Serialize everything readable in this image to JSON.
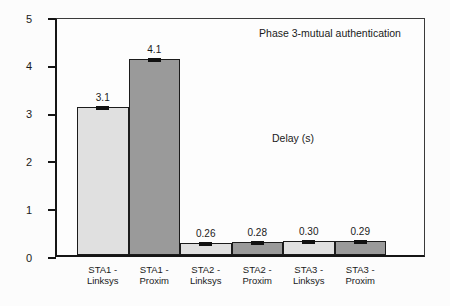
{
  "figure": {
    "background": "#fcfcfc"
  },
  "chart_data": {
    "type": "bar",
    "title": "Phase 3-mutual authentication",
    "annotation": "Delay (s)",
    "categories": [
      "STA1 - Linksys",
      "STA1 - Proxim",
      "STA2 - Linksys",
      "STA2 - Proxim",
      "STA3 - Linksys",
      "STA3 - Proxim"
    ],
    "category_lines": [
      [
        "STA1 -",
        "Linksys"
      ],
      [
        "STA1 -",
        "Proxim"
      ],
      [
        "STA2 -",
        "Linksys"
      ],
      [
        "STA2 -",
        "Proxim"
      ],
      [
        "STA3 -",
        "Linksys"
      ],
      [
        "STA3 -",
        "Proxim"
      ]
    ],
    "values": [
      3.1,
      4.1,
      0.26,
      0.28,
      0.3,
      0.29
    ],
    "value_labels": [
      "3.1",
      "4.1",
      "0.26",
      "0.28",
      "0.30",
      "0.29"
    ],
    "bar_colors": [
      "#e0e0e0",
      "#9a9a9a",
      "#e0e0e0",
      "#9a9a9a",
      "#e0e0e0",
      "#9a9a9a"
    ],
    "series_colors": {
      "linksys": "#e0e0e0",
      "proxim": "#9a9a9a"
    },
    "error_marks": true,
    "xlabel": "",
    "ylabel": "",
    "ylim": [
      0,
      5
    ],
    "yticks": [
      "0",
      "1",
      "2",
      "3",
      "4",
      "5"
    ],
    "grid": false,
    "legend": "none"
  }
}
